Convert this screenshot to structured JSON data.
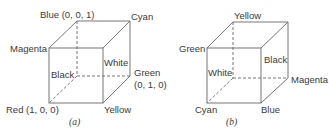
{
  "figures": [
    {
      "caption": "(a)",
      "labels": {
        "blue": "Blue (0, 0, 1)",
        "cyan": "Cyan",
        "magenta": "Magenta",
        "white": "White",
        "black": "Black",
        "green": "Green",
        "green_coord": "(0, 1, 0)",
        "red": "Red (1, 0, 0)",
        "yellow": "Yellow"
      }
    },
    {
      "caption": "(b)",
      "labels": {
        "yellow": "Yellow",
        "green": "Green",
        "black": "Black",
        "white": "White",
        "magenta": "Magenta",
        "cyan": "Cyan",
        "blue": "Blue"
      }
    }
  ],
  "colors": {
    "line": "#555555",
    "text": "#3a3a3a",
    "background": "#ffffff"
  }
}
